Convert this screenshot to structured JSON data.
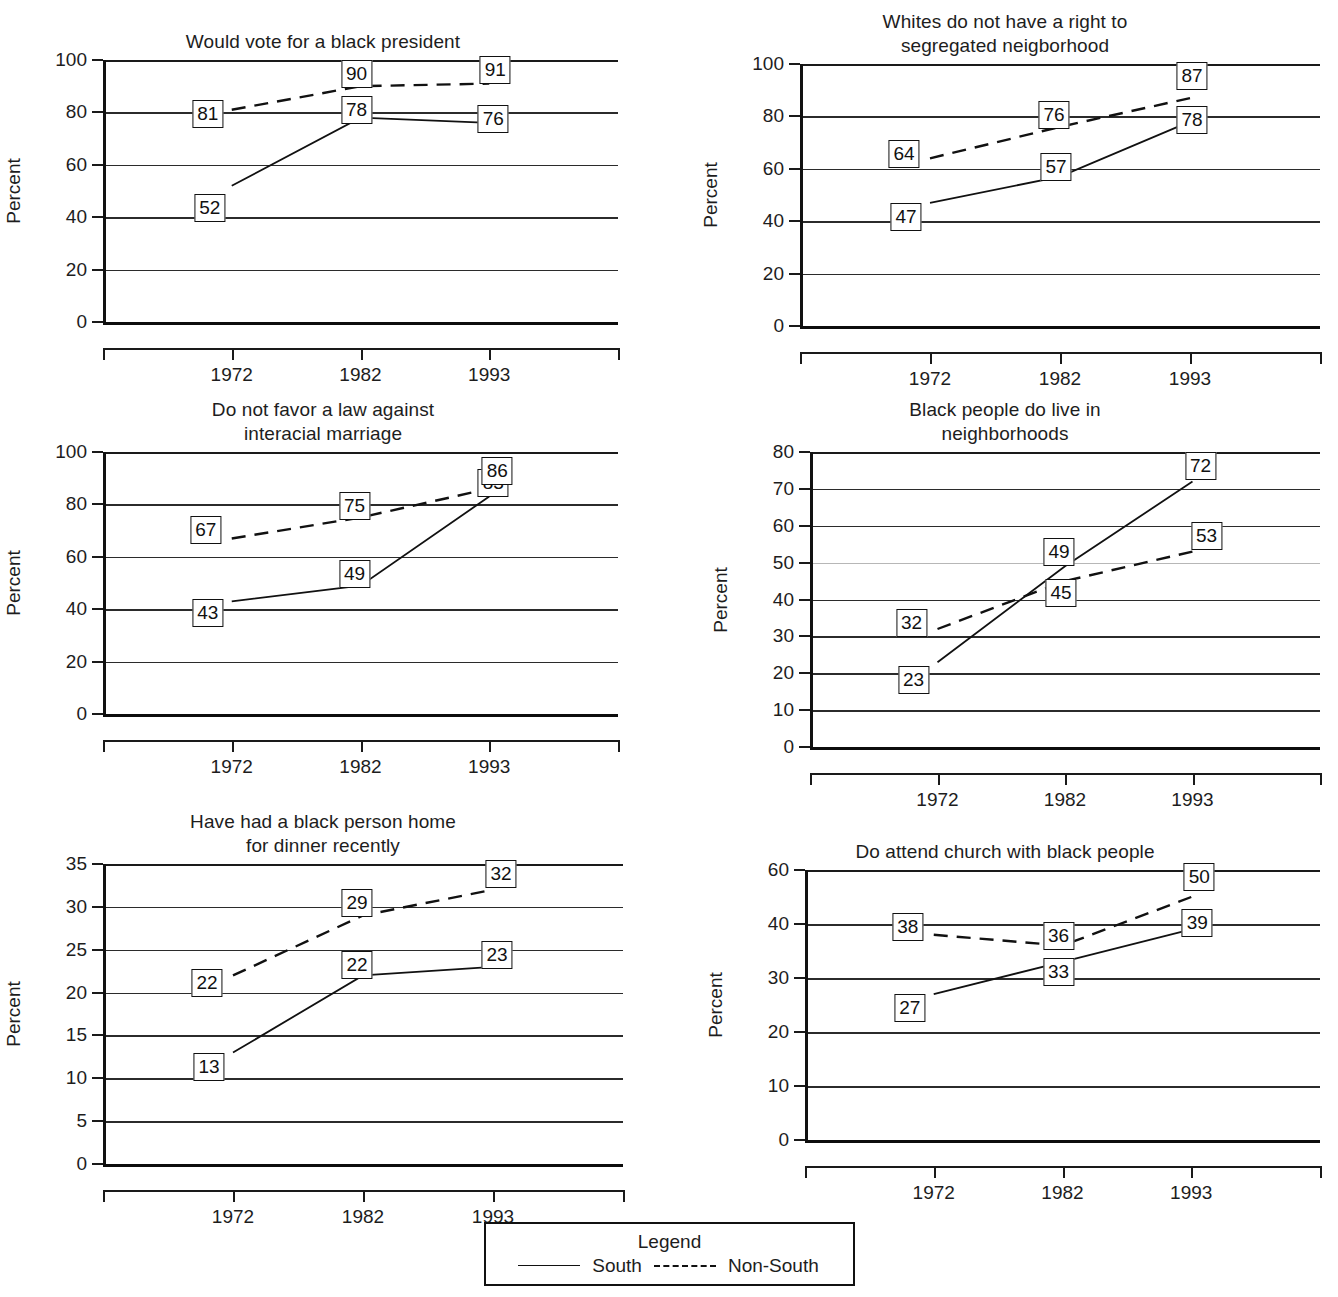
{
  "legend": {
    "title": "Legend",
    "south_label": "South",
    "nonsouth_label": "Non-South",
    "south_style": "solid",
    "nonsouth_style": "dashed"
  },
  "axis_label": "Percent",
  "categories": [
    "1972",
    "1982",
    "1993"
  ],
  "chart_data": [
    {
      "type": "line",
      "title": "Would vote for a black president",
      "xlabel": "",
      "ylabel": "Percent",
      "categories": [
        "1972",
        "1982",
        "1993"
      ],
      "yticks": [
        0,
        20,
        40,
        60,
        80,
        100
      ],
      "ylim": [
        0,
        100
      ],
      "grid": true,
      "legend_position": "bottom",
      "series": [
        {
          "name": "South",
          "style": "solid",
          "values": [
            52,
            78,
            76
          ]
        },
        {
          "name": "Non-South",
          "style": "dashed",
          "values": [
            81,
            90,
            91
          ]
        }
      ]
    },
    {
      "type": "line",
      "title": "Whites do not have a right to\nsegregated neigborhood",
      "xlabel": "",
      "ylabel": "Percent",
      "categories": [
        "1972",
        "1982",
        "1993"
      ],
      "yticks": [
        0,
        20,
        40,
        60,
        80,
        100
      ],
      "ylim": [
        0,
        100
      ],
      "grid": true,
      "legend_position": "bottom",
      "series": [
        {
          "name": "South",
          "style": "solid",
          "values": [
            47,
            57,
            78
          ]
        },
        {
          "name": "Non-South",
          "style": "dashed",
          "values": [
            64,
            76,
            87
          ]
        }
      ]
    },
    {
      "type": "line",
      "title": "Do not favor a law against\ninteracial marriage",
      "xlabel": "",
      "ylabel": "Percent",
      "categories": [
        "1972",
        "1982",
        "1993"
      ],
      "yticks": [
        0,
        20,
        40,
        60,
        80,
        100
      ],
      "ylim": [
        0,
        100
      ],
      "grid": true,
      "legend_position": "bottom",
      "series": [
        {
          "name": "South",
          "style": "solid",
          "values": [
            43,
            49,
            83
          ]
        },
        {
          "name": "Non-South",
          "style": "dashed",
          "values": [
            67,
            75,
            86
          ]
        }
      ]
    },
    {
      "type": "line",
      "title": "Black people do live in\nneighborhoods",
      "xlabel": "",
      "ylabel": "Percent",
      "categories": [
        "1972",
        "1982",
        "1993"
      ],
      "yticks": [
        0,
        10,
        20,
        30,
        40,
        50,
        60,
        70,
        80
      ],
      "ylim": [
        0,
        80
      ],
      "grid": true,
      "legend_position": "bottom",
      "series": [
        {
          "name": "South",
          "style": "solid",
          "values": [
            23,
            49,
            72
          ]
        },
        {
          "name": "Non-South",
          "style": "dashed",
          "values": [
            32,
            45,
            53
          ]
        }
      ]
    },
    {
      "type": "line",
      "title": "Have had a black person home\nfor dinner recently",
      "xlabel": "",
      "ylabel": "Percent",
      "categories": [
        "1972",
        "1982",
        "1993"
      ],
      "yticks": [
        0,
        5,
        10,
        15,
        20,
        25,
        30,
        35
      ],
      "ylim": [
        0,
        35
      ],
      "grid": true,
      "legend_position": "bottom",
      "series": [
        {
          "name": "South",
          "style": "solid",
          "values": [
            13,
            22,
            23
          ]
        },
        {
          "name": "Non-South",
          "style": "dashed",
          "values": [
            22,
            29,
            32
          ]
        }
      ]
    },
    {
      "type": "line",
      "title": "Do attend church with black people",
      "xlabel": "",
      "ylabel": "Percent",
      "categories": [
        "1972",
        "1982",
        "1993"
      ],
      "yticks": [
        0,
        10,
        20,
        30,
        40,
        60
      ],
      "ylim": [
        0,
        60
      ],
      "grid": true,
      "legend_position": "bottom",
      "series": [
        {
          "name": "South",
          "style": "solid",
          "values": [
            27,
            33,
            39
          ]
        },
        {
          "name": "Non-South",
          "style": "dashed",
          "values": [
            38,
            36,
            50
          ]
        }
      ]
    }
  ]
}
